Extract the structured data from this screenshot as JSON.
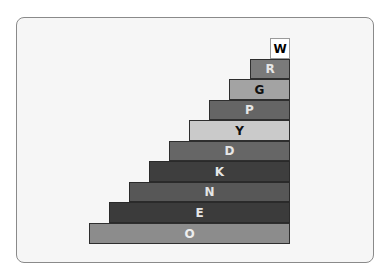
{
  "diagram": {
    "type": "staircase",
    "right_edge": 290,
    "steps": [
      {
        "label": "W",
        "left": 270,
        "top": 38,
        "height": 21,
        "bg": "#ffffff",
        "fg": "#000000",
        "border": "#9a9a9a"
      },
      {
        "label": "R",
        "left": 250,
        "top": 59,
        "height": 20,
        "bg": "#7a7a7a",
        "fg": "#e6e6e6",
        "border": "#2e2e2e"
      },
      {
        "label": "G",
        "left": 229,
        "top": 79,
        "height": 21,
        "bg": "#a3a3a3",
        "fg": "#111111",
        "border": "#2e2e2e"
      },
      {
        "label": "P",
        "left": 209,
        "top": 100,
        "height": 20,
        "bg": "#656565",
        "fg": "#e6e6e6",
        "border": "#2e2e2e"
      },
      {
        "label": "Y",
        "left": 189,
        "top": 120,
        "height": 21,
        "bg": "#cacaca",
        "fg": "#111111",
        "border": "#2e2e2e"
      },
      {
        "label": "D",
        "left": 169,
        "top": 141,
        "height": 20,
        "bg": "#666666",
        "fg": "#e6e6e6",
        "border": "#2e2e2e"
      },
      {
        "label": "K",
        "left": 149,
        "top": 161,
        "height": 21,
        "bg": "#3e3e3e",
        "fg": "#e6e6e6",
        "border": "#2a2a2a"
      },
      {
        "label": "N",
        "left": 129,
        "top": 182,
        "height": 20,
        "bg": "#575757",
        "fg": "#e6e6e6",
        "border": "#2a2a2a"
      },
      {
        "label": "E",
        "left": 109,
        "top": 202,
        "height": 21,
        "bg": "#3b3b3b",
        "fg": "#e6e6e6",
        "border": "#2a2a2a"
      },
      {
        "label": "O",
        "left": 89,
        "top": 223,
        "height": 21,
        "bg": "#8c8c8c",
        "fg": "#eeeeee",
        "border": "#2e2e2e"
      }
    ]
  }
}
